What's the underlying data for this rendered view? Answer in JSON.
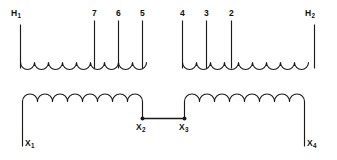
{
  "diagram": {
    "type": "transformer-winding-schematic",
    "title": "",
    "line_color": "#1a1a1a",
    "background_color": "#ffffff",
    "windings": [
      {
        "id": "primary-left",
        "position": "upper-left",
        "turns": 9,
        "arc_direction": "down",
        "terminals": [
          "H1",
          "7",
          "6",
          "5"
        ]
      },
      {
        "id": "primary-right",
        "position": "upper-right",
        "turns": 9,
        "arc_direction": "down",
        "terminals": [
          "4",
          "3",
          "2",
          "H2"
        ]
      },
      {
        "id": "secondary-left",
        "position": "lower-left",
        "turns": 8,
        "arc_direction": "up",
        "terminals": [
          "X1",
          "X2"
        ]
      },
      {
        "id": "secondary-right",
        "position": "lower-right",
        "turns": 8,
        "arc_direction": "up",
        "terminals": [
          "X3",
          "X4"
        ]
      }
    ],
    "jumper": {
      "from": "X2",
      "to": "X3",
      "has_nodes": true
    },
    "labels": {
      "h1": {
        "text": "H",
        "sub": "1"
      },
      "tap7": {
        "text": "7"
      },
      "tap6": {
        "text": "6"
      },
      "tap5": {
        "text": "5"
      },
      "tap4": {
        "text": "4"
      },
      "tap3": {
        "text": "3"
      },
      "tap2": {
        "text": "2"
      },
      "h2": {
        "text": "H",
        "sub": "2"
      },
      "x1": {
        "text": "X",
        "sub": "1"
      },
      "x2": {
        "text": "X",
        "sub": "2"
      },
      "x3": {
        "text": "X",
        "sub": "3"
      },
      "x4": {
        "text": "X",
        "sub": "4"
      }
    }
  }
}
